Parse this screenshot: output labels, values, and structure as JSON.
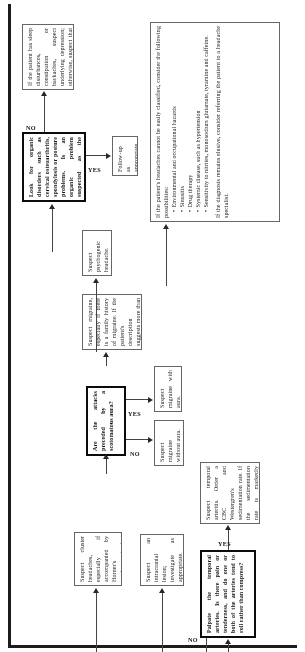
{
  "document": {
    "type": "clinical-decision-flowchart",
    "topic": "Headache evaluation algorithm",
    "orientation": "landscape chart printed sideways on a portrait page"
  },
  "nodes": {
    "palpate_temporal": {
      "id": "palpate-temporal-arteries",
      "shape": "decision",
      "text": "Palpate the temporal arteries. Is there pain or tenderness, and do one or both of the arteries tend to roll rather than compress?"
    },
    "temporal_arteritis": {
      "id": "suspect-temporal-arteritis",
      "shape": "process",
      "text": "Suspect temporal arteritis. Order a CBC and Westergren's sedimentation rate. If the sedimentation rate is markedly elevated, a temporal artery biopsy is indicated."
    },
    "intracranial_lesion": {
      "id": "suspect-intracranial-lesion",
      "shape": "process",
      "text": "Suspect an intracranial lesion; investigate as appropriate."
    },
    "cluster_headaches": {
      "id": "suspect-cluster-headaches",
      "shape": "process",
      "text": "Suspect cluster headaches, especially if accompanied by Horner's syndrome, tearing and nasal stuffiness."
    },
    "scotomatous_aura": {
      "id": "attacks-preceded-by-scotomatous-aura",
      "shape": "decision",
      "text": "Are the attacks preceded by a scotomatous aura?"
    },
    "migraine_with_aura": {
      "id": "suspect-migraine-with-aura",
      "shape": "process",
      "text": "Suspect migraine with aura."
    },
    "migraine_without_aura": {
      "id": "suspect-migraine-without-aura",
      "shape": "process",
      "text": "Suspect migraine without aura."
    },
    "family_history_migraine": {
      "id": "suspect-migraine-family-history",
      "shape": "process",
      "text": "Suspect migraine, especially if there is a family history of migraine. If the patient's description suggests more than one type of headache, suspect concurrent tension-type headache."
    },
    "psychogenic": {
      "id": "suspect-psychogenic-headache",
      "shape": "process",
      "text": "Suspect psychogenic headache."
    },
    "organic_disorders": {
      "id": "look-for-organic-disorders",
      "shape": "decision",
      "text": "Look for organic disorders such as cervical osteoarthritis, spondylosis or posture problems. Is an organic problem suspected as the underlying cause of muscle contraction?"
    },
    "follow_up": {
      "id": "follow-up-as-appropriate",
      "shape": "process",
      "text": "Follow-up as appropriate."
    },
    "sleep_disturbances": {
      "id": "sleep-disturbances-depression-stress",
      "shape": "process",
      "text": "If the patient has sleep disturbances, constipation or backaches, suspect underlying depression; otherwise, suspect that muscle contraction is due to stress."
    },
    "unclassified": {
      "id": "unclassified-headache-possibilities",
      "shape": "process",
      "intro": "If the patient's headaches cannot be easily classified, consider the following possibilities:",
      "bullets": [
        "Environmental and occupational hazards",
        "Sinusitis",
        "Drug therapy",
        "Systemic disease, such as hypertension",
        "Sensitivity to nitrites, monosodium glutamate, tyramine and caffeine."
      ],
      "closing": "If the diagnosis remains elusive, consider referring the patient to a headache specialist."
    }
  },
  "edges": {
    "yes": "YES",
    "no": "NO"
  }
}
